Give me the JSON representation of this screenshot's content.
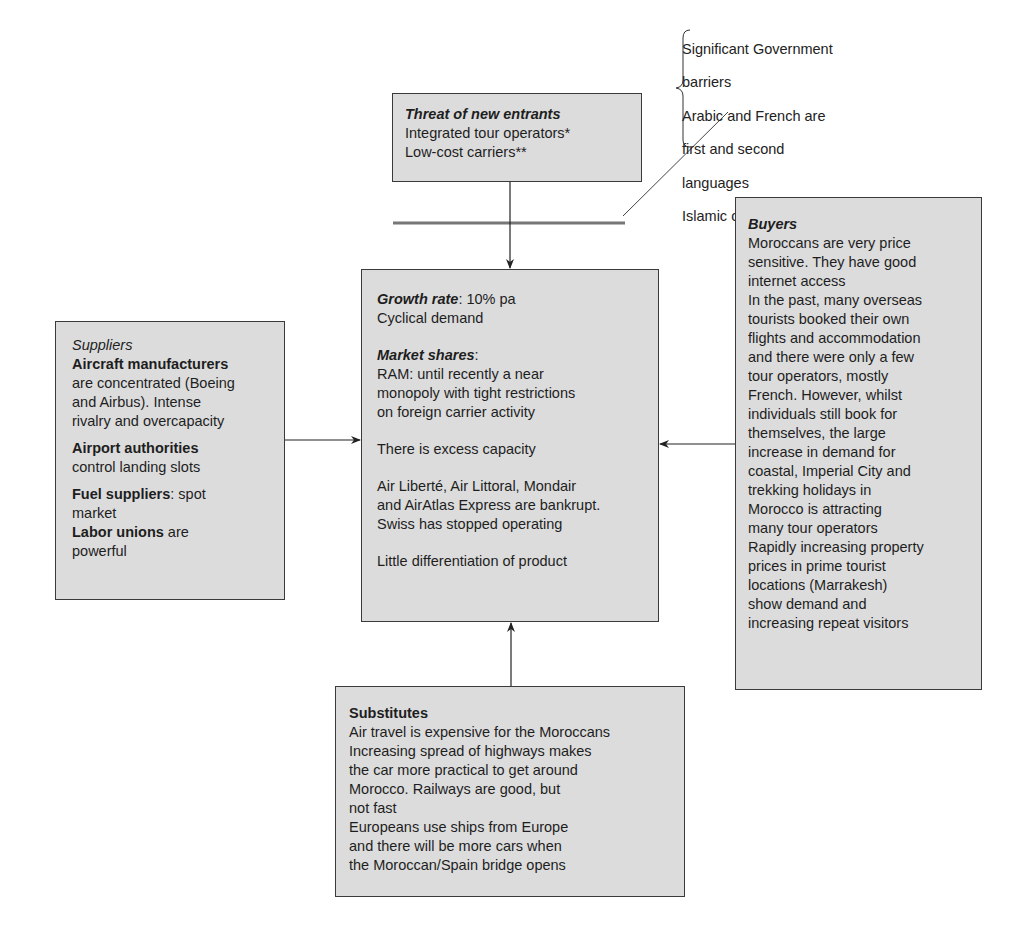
{
  "colors": {
    "box_fill": "#dcdcdc",
    "box_border": "#3a3a3a",
    "line": "#333333",
    "barrier_bar": "#777777"
  },
  "barriers_note": {
    "lines": [
      "Significant Government",
      "barriers",
      "Arabic and French are",
      "first and second",
      "languages",
      "Islamic country"
    ]
  },
  "threat": {
    "title": "Threat of new entrants",
    "lines": [
      "Integrated tour operators*",
      "Low-cost carriers**"
    ]
  },
  "center": {
    "growth_label": "Growth rate",
    "growth_value": ": 10% pa",
    "cyclical": "Cyclical demand",
    "market_label": "Market shares",
    "market_colon": ":",
    "ram_lines": [
      "RAM: until recently a near",
      "monopoly with tight restrictions",
      "on foreign carrier activity"
    ],
    "excess": "There is excess capacity",
    "bankrupt_lines": [
      "Air Liberté, Air Littoral, Mondair",
      "and AirAtlas Express are bankrupt.",
      "Swiss has stopped operating"
    ],
    "differentiation": "Little differentiation of product"
  },
  "suppliers": {
    "title": "Suppliers",
    "aircraft_label": "Aircraft manufacturers",
    "aircraft_lines": [
      "are concentrated (Boeing",
      "and Airbus). Intense",
      "rivalry and overcapacity"
    ],
    "airport_label": "Airport authorities",
    "airport_text": "control landing slots",
    "fuel_label": "Fuel suppliers",
    "fuel_text": ": spot",
    "fuel_text2": "market",
    "labor_label": "Labor unions",
    "labor_text": " are",
    "labor_text2": "powerful"
  },
  "buyers": {
    "title": "Buyers",
    "lines": [
      "Moroccans are very price",
      "sensitive. They have good",
      "internet access",
      "In the past, many overseas",
      "tourists booked their own",
      "flights and accommodation",
      "and there were only a few",
      "tour operators, mostly",
      "French. However, whilst",
      "individuals still book for",
      "themselves, the large",
      "increase in demand for",
      "coastal, Imperial City and",
      "trekking holidays in",
      "Morocco is attracting",
      "many tour operators",
      "Rapidly increasing property",
      "prices in prime tourist",
      "locations (Marrakesh)",
      "show demand and",
      "increasing repeat visitors"
    ]
  },
  "substitutes": {
    "title": "Substitutes",
    "lines": [
      "Air travel is expensive for the Moroccans",
      "Increasing spread of highways makes",
      "the car more practical to get around",
      "Morocco. Railways are good, but",
      "not fast",
      "Europeans use ships from Europe",
      "and there will be more cars when",
      "the Moroccan/Spain bridge opens"
    ]
  }
}
